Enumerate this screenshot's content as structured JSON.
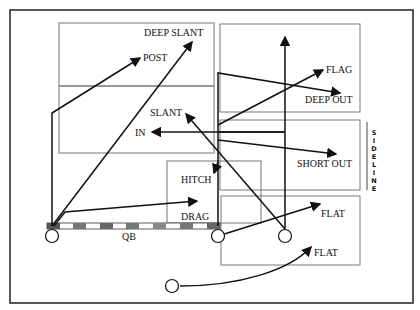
{
  "diagram": {
    "labels": {
      "deep_slant": "DEEP SLANT",
      "post": "POST",
      "slant": "SLANT",
      "in": "IN",
      "flag": "FLAG",
      "deep_out": "DEEP OUT",
      "short_out": "SHORT OUT",
      "hitch": "HITCH",
      "drag": "DRAG",
      "flat_upper": "FLAT",
      "flat_lower": "FLAT",
      "qb": "QB"
    },
    "sideline": [
      "S",
      "I",
      "D",
      "E",
      "L",
      "I",
      "N",
      "E"
    ],
    "colors": {
      "line": "#111111",
      "box": "#777777",
      "scrimmage_dark": "#555555",
      "scrimmage_light": "#ffffff"
    }
  }
}
